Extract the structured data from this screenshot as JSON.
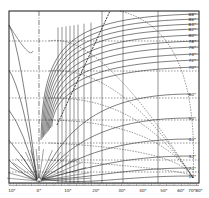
{
  "chart_data": {
    "type": "line",
    "title": "",
    "xlabel": "",
    "ylabel": "",
    "grid": true,
    "frame": {
      "left": 9,
      "top": 11,
      "right": 199,
      "bottom": 183
    },
    "focus": {
      "x": 39,
      "y": 181
    },
    "x_axis": {
      "tick_labels": [
        "10°",
        "0°",
        "10°",
        "20°",
        "30°",
        "40°",
        "50°",
        "60°",
        "70°",
        "80°"
      ],
      "tick_positions_px": [
        12,
        39,
        68,
        96,
        122,
        143,
        164,
        181,
        192,
        199
      ]
    },
    "right_labels_upper": {
      "labels": [
        "88°",
        "86°",
        "84°",
        "82°",
        "80°",
        "78°",
        "76°",
        "74°",
        "72°",
        "70°"
      ],
      "y_px": [
        14,
        19,
        24,
        29,
        35,
        41,
        47,
        54,
        60,
        67
      ]
    },
    "right_labels_lower": {
      "labels": [
        "60°",
        "50°",
        "40°",
        "30°",
        "20°",
        "10°"
      ],
      "y_px": [
        94,
        118,
        139,
        156,
        168,
        176
      ]
    },
    "horizontal_dashed_gridlines_y_px": [
      41,
      71,
      98,
      120,
      143,
      160,
      172
    ],
    "vertical_gridlines_x_px": [
      58,
      62,
      66,
      70,
      74,
      78,
      84,
      91,
      102,
      123,
      158
    ],
    "dash_dot_vertical_x_px": 39,
    "dashed_diagonal": {
      "from": [
        57,
        125
      ],
      "to": [
        110,
        11
      ]
    },
    "series": [
      {
        "name": "88°",
        "end_y": 14
      },
      {
        "name": "86°",
        "end_y": 19
      },
      {
        "name": "84°",
        "end_y": 24
      },
      {
        "name": "82°",
        "end_y": 29
      },
      {
        "name": "80°",
        "end_y": 35
      },
      {
        "name": "78°",
        "end_y": 41
      },
      {
        "name": "76°",
        "end_y": 47
      },
      {
        "name": "74°",
        "end_y": 54
      },
      {
        "name": "72°",
        "end_y": 60
      },
      {
        "name": "70°",
        "end_y": 67
      },
      {
        "name": "60°",
        "end_y": 94
      },
      {
        "name": "50°",
        "end_y": 118
      },
      {
        "name": "40°",
        "end_y": 139
      },
      {
        "name": "30°",
        "end_y": 156
      },
      {
        "name": "20°",
        "end_y": 168
      },
      {
        "name": "10°",
        "end_y": 176
      }
    ],
    "colors": {
      "line": "#2a2a2a",
      "background": "#ffffff"
    }
  }
}
